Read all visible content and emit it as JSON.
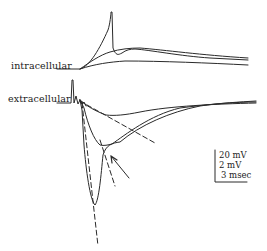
{
  "figure": {
    "labels": {
      "intracellular": "intracellular",
      "extracellular": "extracellular"
    },
    "scale_bar": {
      "line1": "20 mV",
      "line2": "2 mV",
      "line3": "3 msec"
    },
    "colors": {
      "trace": "#2a2a2a",
      "background": "#ffffff"
    }
  }
}
